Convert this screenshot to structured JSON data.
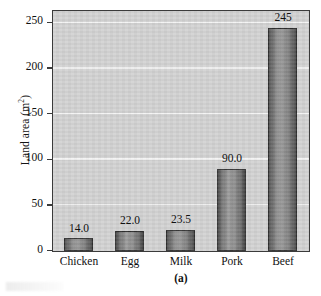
{
  "chart_data": {
    "type": "bar",
    "title": "",
    "subtitle": "",
    "categories": [
      "Chicken",
      "Egg",
      "Milk",
      "Pork",
      "Beef"
    ],
    "values": [
      14.0,
      22.0,
      23.5,
      90.0,
      245
    ],
    "value_labels": [
      "14.0",
      "22.0",
      "23.5",
      "90.0",
      "245"
    ],
    "xlabel": "",
    "ylabel": "Land area (m",
    "ylabel_superscript": "2",
    "ylabel_suffix": ")",
    "ylim": [
      0,
      262
    ],
    "yticks": [
      0,
      50,
      100,
      150,
      200,
      250
    ],
    "ytick_labels": [
      "0",
      "50",
      "100",
      "150",
      "200",
      "250"
    ],
    "grid": true,
    "grid_axis": "y",
    "grid_color": "#f4f4f4",
    "legend": null,
    "panel_background": "#d2d2d2",
    "bar_color": "#8d8d8d",
    "bar_edge_color": "#2e2e2e",
    "axis_color": "#3b3b3b"
  },
  "caption": {
    "text": "(a)"
  }
}
